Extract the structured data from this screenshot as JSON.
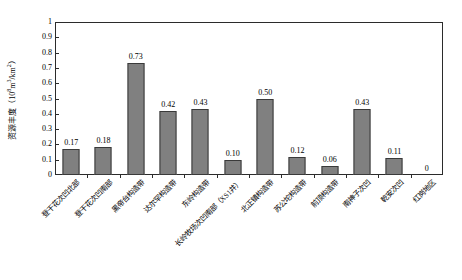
{
  "chart_data": {
    "type": "bar",
    "title": "",
    "xlabel": "",
    "ylabel": "资源丰度（10⁸m³/km²）",
    "ylabel_main": "资源丰度（10",
    "ylabel_sup": "8",
    "ylabel_mid": "m",
    "ylabel_sup2": "3",
    "ylabel_tail": "/km",
    "ylabel_sup3": "2",
    "ylabel_end": "）",
    "ylim": [
      0,
      1
    ],
    "ytick_step": 0.1,
    "ytick_labels": [
      "1",
      "0.9",
      "0.8",
      "0.7",
      "0.6",
      "0.5",
      "0.4",
      "0.3",
      "0.2",
      "0.1",
      "0"
    ],
    "ytick_values": [
      1,
      0.9,
      0.8,
      0.7,
      0.6,
      0.5,
      0.4,
      0.3,
      0.2,
      0.1,
      0
    ],
    "grid": false,
    "legend": null,
    "bar_color": "#808080",
    "bar_edge_color": "#3a3a3a",
    "axis_color": "#2b2b2b",
    "categories": [
      "登干花次凹北部",
      "登干花次凹南部",
      "黑帝台构造带",
      "达尔罕构造带",
      "东岭构造带",
      "长岭牧场次凹南部（XS1井）",
      "北正镇构造带",
      "苏公坨构造带",
      "前顶构造带",
      "南神子次凹",
      "乾安次凹",
      "红岗地区"
    ],
    "values": [
      0.17,
      0.18,
      0.73,
      0.42,
      0.43,
      0.1,
      0.5,
      0.12,
      0.06,
      0.43,
      0.11,
      0
    ],
    "value_labels": [
      "0.17",
      "0.18",
      "0.73",
      "0.42",
      "0.43",
      "0.10",
      "0.50",
      "0.12",
      "0.06",
      "0.43",
      "0.11",
      "0"
    ]
  }
}
